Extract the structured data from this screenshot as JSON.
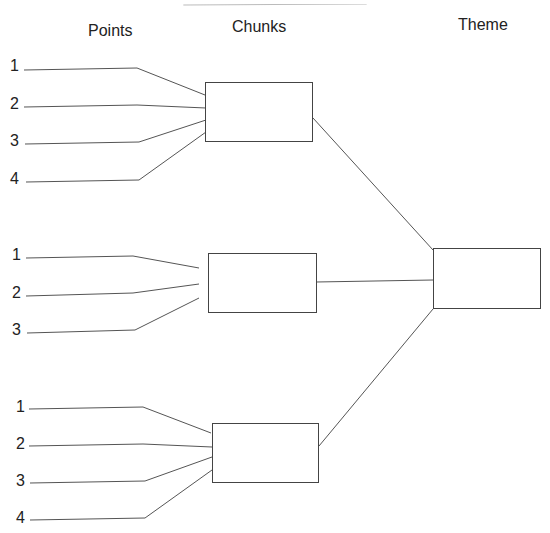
{
  "headers": {
    "points": "Points",
    "chunks": "Chunks",
    "theme": "Theme"
  },
  "groups": [
    {
      "points": [
        "1",
        "2",
        "3",
        "4"
      ]
    },
    {
      "points": [
        "1",
        "2",
        "3"
      ]
    },
    {
      "points": [
        "1",
        "2",
        "3",
        "4"
      ]
    }
  ],
  "colors": {
    "line": "#555555",
    "box_border": "#444444",
    "text": "#222222"
  }
}
